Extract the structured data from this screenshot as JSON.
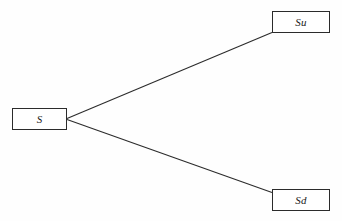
{
  "diagram": {
    "background_color": "#fefefe",
    "line_color": "#2b2b2b",
    "text_color": "#1a1a1a",
    "nodes": [
      {
        "id": "s",
        "label": "S",
        "name": "node-s"
      },
      {
        "id": "su",
        "label": "Su",
        "name": "node-su"
      },
      {
        "id": "sd",
        "label": "Sd",
        "name": "node-sd"
      }
    ],
    "edges": [
      {
        "id": "up",
        "from": "S",
        "to": "Su"
      },
      {
        "id": "down",
        "from": "S",
        "to": "Sd"
      }
    ]
  },
  "artifacts": {
    "ghost_mid": "",
    "ghost_bottom_1": "",
    "ghost_bottom_2": ""
  }
}
